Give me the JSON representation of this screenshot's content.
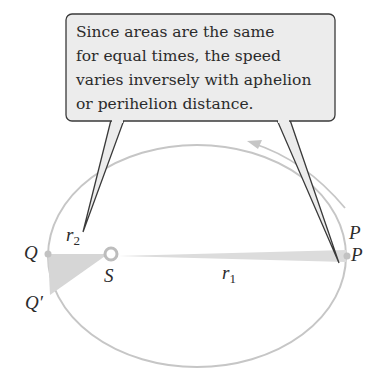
{
  "callout": {
    "lines": [
      "Since areas are the same",
      "for equal times, the speed",
      "varies inversely with aphelion",
      "or perihelion distance."
    ]
  },
  "labels": {
    "Q": "Q",
    "Q_prime": "Q′",
    "S": "S",
    "P_top": "P",
    "P": "P",
    "r1_base": "r",
    "r1_sub": "1",
    "r2_base": "r",
    "r2_sub": "2"
  },
  "colors": {
    "orbit": "#c9c9c9",
    "wedge": "#d9d9d9",
    "callout_fill": "#ececec",
    "callout_stroke": "#3a3a3a",
    "text": "#2b2b2b"
  }
}
